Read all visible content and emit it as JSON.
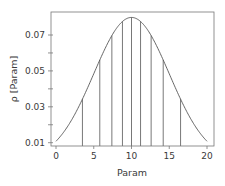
{
  "chart_data": {
    "type": "line",
    "title": "",
    "xlabel": "Param",
    "ylabel": "ρ [Param]",
    "xlim": [
      -1,
      21
    ],
    "ylim": [
      0.009,
      0.081
    ],
    "xticks": [
      0,
      5,
      10,
      15,
      20
    ],
    "xtick_labels": [
      "0",
      "5",
      "10",
      "15",
      "20"
    ],
    "yticks": [
      0.01,
      0.02,
      0.03,
      0.04,
      0.05,
      0.06,
      0.07
    ],
    "ytick_labels": [
      "0.01",
      "",
      "0.03",
      "",
      "0.05",
      "",
      "0.07"
    ],
    "grid": false,
    "legend": null,
    "series": [
      {
        "name": "normal pdf (mean 10, sd 5)",
        "x": [
          0,
          1,
          2,
          3,
          4,
          5,
          6,
          7,
          8,
          9,
          10,
          11,
          12,
          13,
          14,
          15,
          16,
          17,
          18,
          19,
          20
        ],
        "y": [
          0.0108,
          0.0158,
          0.0222,
          0.03,
          0.0391,
          0.0484,
          0.0579,
          0.0666,
          0.0737,
          0.0782,
          0.0798,
          0.0782,
          0.0737,
          0.0666,
          0.0579,
          0.0484,
          0.0391,
          0.03,
          0.0222,
          0.0158,
          0.0108
        ]
      }
    ],
    "vertical_lines": {
      "description": "quantile partition lines from x-axis up to the curve",
      "x": [
        3.5,
        5.8,
        7.4,
        8.8,
        10.0,
        11.2,
        12.6,
        14.2,
        16.5
      ]
    },
    "colors": {
      "curve": "#555555",
      "lines": "#555555",
      "frame": "#666666",
      "text": "#3a3a3a"
    }
  }
}
